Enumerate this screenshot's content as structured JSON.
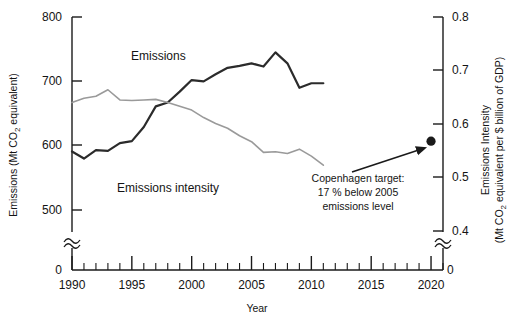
{
  "chart_data": {
    "type": "line",
    "title": "",
    "xlabel": "Year",
    "ylabel_left_line1": "Emissions (Mt CO",
    "ylabel_left_sub": "2",
    "ylabel_left_line2": " equivalent)",
    "ylabel_right_line1": "Emissions Intensity",
    "ylabel_right_line2a": "(Mt CO",
    "ylabel_right_sub": "2",
    "ylabel_right_line2b": " equivalent  per $ billion of GDP)",
    "xlim": [
      1990,
      2021
    ],
    "xticks": [
      1990,
      1995,
      2000,
      2005,
      2010,
      2015,
      2020
    ],
    "xticklabels": [
      "1990",
      "1995",
      "2000",
      "2005",
      "2010",
      "2015",
      "2020"
    ],
    "x_minor_step": 1,
    "ylim_left": [
      500,
      800
    ],
    "yticks_left": [
      500,
      600,
      700,
      800
    ],
    "yticklabels_left": [
      "500",
      "600",
      "700",
      "800"
    ],
    "y_left_zero_label": "0",
    "ylim_right": [
      0.4,
      0.8
    ],
    "yticks_right": [
      0.4,
      0.5,
      0.6,
      0.7,
      0.8
    ],
    "yticklabels_right": [
      "0.4",
      "0.5",
      "0.6",
      "0.7",
      "0.8"
    ],
    "y_right_zero_label": "0",
    "axis_break": true,
    "grid": false,
    "legend_position": "inline-labels",
    "series": [
      {
        "name": "Emissions",
        "axis": "left",
        "color": "#2b2b2b",
        "label_text": "Emissions",
        "x": [
          1990,
          1991,
          1992,
          1993,
          1994,
          1995,
          1996,
          1997,
          1998,
          1999,
          2000,
          2001,
          2002,
          2003,
          2004,
          2005,
          2006,
          2007,
          2008,
          2009,
          2010,
          2011
        ],
        "values": [
          591,
          580,
          593,
          592,
          604,
          607,
          629,
          661,
          667,
          684,
          702,
          700,
          711,
          721,
          724,
          728,
          723,
          745,
          728,
          690,
          697,
          697
        ]
      },
      {
        "name": "Emissions intensity",
        "axis": "right",
        "color": "#9a9a9a",
        "label_text": "Emissions intensity",
        "x": [
          1990,
          1991,
          1992,
          1993,
          1994,
          1995,
          1996,
          1997,
          1998,
          1999,
          2000,
          2001,
          2002,
          2003,
          2004,
          2005,
          2006,
          2007,
          2008,
          2009,
          2010,
          2011
        ],
        "values": [
          0.64,
          0.648,
          0.652,
          0.664,
          0.645,
          0.644,
          0.645,
          0.646,
          0.64,
          0.633,
          0.626,
          0.612,
          0.601,
          0.592,
          0.578,
          0.567,
          0.547,
          0.548,
          0.545,
          0.553,
          0.54,
          0.523
        ]
      }
    ],
    "annotations": [
      {
        "name": "copenhagen-target",
        "line1": "Copenhagen target:",
        "line2": "17 % below 2005",
        "line3": "emissions level",
        "point_x": 2020,
        "point_value_left": 607,
        "marker": "filled-circle",
        "marker_color": "#1a1a1a",
        "arrow": true
      }
    ]
  }
}
